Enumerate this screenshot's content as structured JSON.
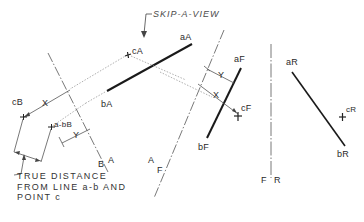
{
  "title_annotation": "SKIP-A-VIEW",
  "note": {
    "line1": "TRUE DISTANCE",
    "line2": "FROM LINE a-b AND",
    "line3": "POINT c"
  },
  "views": {
    "A": {
      "point_a": "aA",
      "point_b": "bA",
      "point_c": "cA"
    },
    "B": {
      "point_c": "cB",
      "line_point": "a-bB"
    },
    "F": {
      "point_a": "aF",
      "point_b": "bF",
      "point_c": "cF"
    },
    "R": {
      "point_a": "aR",
      "point_b": "bR",
      "point_c": "cR"
    }
  },
  "fold_lines": {
    "BA": {
      "left": "B",
      "right": "A"
    },
    "AF": {
      "left": "A",
      "right": "F"
    },
    "FR": {
      "left": "F",
      "right": "R"
    }
  },
  "dimensions": {
    "x_label": "X",
    "y_label": "Y"
  },
  "colors": {
    "ink": "#2a2a2a",
    "construction": "#9a9a9a",
    "background": "#ffffff"
  }
}
